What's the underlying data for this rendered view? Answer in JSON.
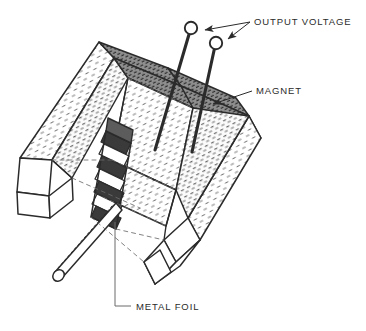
{
  "figure": {
    "background_color": "#ffffff",
    "ink_color": "#2b2b2b",
    "style": "scanned engineering line drawing with stippled hatching"
  },
  "labels": {
    "output_voltage": "OUTPUT VOLTAGE",
    "magnet": "MAGNET",
    "metal_foil": "METAL FOIL"
  },
  "parts": {
    "magnet_yoke": "magnet",
    "left_arm": "magnet left arm",
    "right_arm": "magnet right arm",
    "foil_stack": "metal foil stack",
    "probe_rod": "probe rod",
    "terminal_1": "output terminal 1",
    "terminal_2": "output terminal 2",
    "lead_wire_1": "lead wire 1",
    "lead_wire_2": "lead wire 2"
  },
  "colors": {
    "ink": "#2b2b2b",
    "hatch": "#6d6d6d",
    "shade_dark": "#5a5a5a",
    "paper": "#ffffff"
  }
}
